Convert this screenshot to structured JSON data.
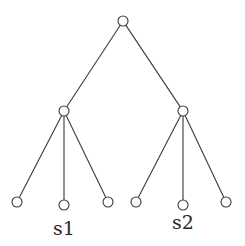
{
  "diagram": {
    "type": "tree",
    "node_radius": 5,
    "colors": {
      "stroke": "#3a3a3a",
      "fill": "#ffffff",
      "text": "#2a2a2a"
    },
    "nodes": [
      {
        "id": "root",
        "x": 123,
        "y": 21
      },
      {
        "id": "left",
        "x": 64,
        "y": 111
      },
      {
        "id": "right",
        "x": 183,
        "y": 111
      },
      {
        "id": "l1",
        "x": 17,
        "y": 202
      },
      {
        "id": "l2",
        "x": 64,
        "y": 205
      },
      {
        "id": "l3",
        "x": 108,
        "y": 202
      },
      {
        "id": "r1",
        "x": 136,
        "y": 202
      },
      {
        "id": "r2",
        "x": 183,
        "y": 205
      },
      {
        "id": "r3",
        "x": 226,
        "y": 202
      }
    ],
    "edges": [
      [
        "root",
        "left"
      ],
      [
        "root",
        "right"
      ],
      [
        "left",
        "l1"
      ],
      [
        "left",
        "l2"
      ],
      [
        "left",
        "l3"
      ],
      [
        "right",
        "r1"
      ],
      [
        "right",
        "r2"
      ],
      [
        "right",
        "r3"
      ]
    ],
    "labels": [
      {
        "node": "l2",
        "text": "s1",
        "x": 64,
        "y": 235
      },
      {
        "node": "r2",
        "text": "s2",
        "x": 183,
        "y": 229
      }
    ]
  }
}
